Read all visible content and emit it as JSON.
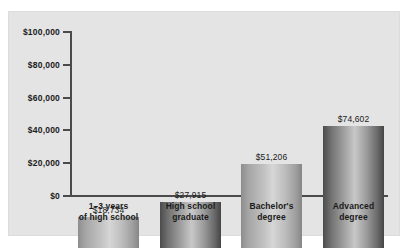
{
  "chart_data": {
    "type": "bar",
    "title": "",
    "xlabel": "",
    "ylabel": "",
    "categories": [
      "1–3 years\nof high school",
      "High school\ngraduate",
      "Bachelor's\ndegree",
      "Advanced\ndegree"
    ],
    "category_lines": [
      [
        "1–3 years",
        "of high school"
      ],
      [
        "High school",
        "graduate"
      ],
      [
        "Bachelor's",
        "degree"
      ],
      [
        "Advanced",
        "degree"
      ]
    ],
    "values": [
      18734,
      27915,
      51206,
      74602
    ],
    "value_labels": [
      "$18,734",
      "$27,915",
      "$51,206",
      "$74,602"
    ],
    "ylim": [
      0,
      100000
    ],
    "yticks": [
      0,
      20000,
      40000,
      60000,
      80000,
      100000
    ],
    "ytick_labels": [
      "$0",
      "$20,000",
      "$40,000",
      "$60,000",
      "$80,000",
      "$100,000"
    ],
    "grid": false,
    "legend": "none",
    "bar_shading": "cylindrical-gradient",
    "colors": {
      "panel_background": "#e4e4e4",
      "figure_background": "#ffffff",
      "axis": "#4a4a4a",
      "text": "#1a1a1a",
      "bar_dark_edge": "#4c4c4c",
      "bar_light_center": "#c8c8c8",
      "bar_light_edge": "#8d8d8d",
      "bar_light_center_alt": "#d6d6d6"
    },
    "bar_styles": [
      "light",
      "dark",
      "light",
      "dark"
    ]
  }
}
